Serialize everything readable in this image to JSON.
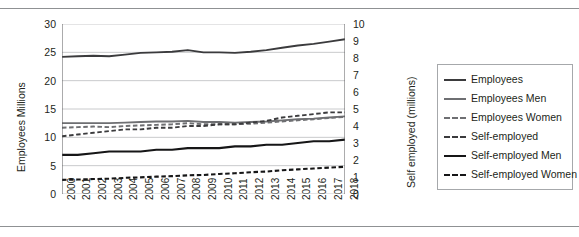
{
  "chart_data": {
    "type": "line",
    "title": "",
    "xlabel": "",
    "ylabel": "Employees Millions",
    "y2label": "Self employed (millions)",
    "grid": true,
    "legend_position": "right",
    "x": [
      2000,
      2001,
      2002,
      2003,
      2004,
      2005,
      2006,
      2007,
      2008,
      2009,
      2010,
      2011,
      2012,
      2013,
      2014,
      2015,
      2016,
      2017,
      2018
    ],
    "categories": [
      "2000",
      "2001",
      "2002",
      "2003",
      "2004",
      "2005",
      "2006",
      "2007",
      "2008",
      "2009",
      "2010",
      "2011",
      "2012",
      "2013",
      "2014",
      "2015",
      "2016",
      "2017",
      "2018"
    ],
    "ylim": [
      0,
      30
    ],
    "yticks": [
      0,
      5,
      10,
      15,
      20,
      25,
      30
    ],
    "y2lim": [
      0,
      10
    ],
    "y2ticks": [
      0,
      1,
      2,
      3,
      4,
      5,
      6,
      7,
      8,
      9,
      10
    ],
    "series": [
      {
        "name": "Employees",
        "axis": "left",
        "style": "solid",
        "color": "#3b3b3d",
        "values": [
          24.2,
          24.3,
          24.4,
          24.3,
          24.6,
          24.9,
          25.0,
          25.1,
          25.4,
          25.0,
          25.0,
          24.9,
          25.1,
          25.4,
          25.8,
          26.2,
          26.5,
          26.9,
          27.3
        ]
      },
      {
        "name": "Employees Men",
        "axis": "left",
        "style": "solid",
        "color": "#6e6f72",
        "values": [
          12.5,
          12.5,
          12.5,
          12.5,
          12.6,
          12.7,
          12.8,
          12.8,
          12.9,
          12.7,
          12.7,
          12.6,
          12.7,
          12.8,
          13.0,
          13.2,
          13.3,
          13.5,
          13.7
        ]
      },
      {
        "name": "Employees Women",
        "axis": "left",
        "style": "dashed",
        "color": "#6e6f72",
        "values": [
          11.7,
          11.8,
          11.9,
          11.8,
          12.0,
          12.1,
          12.2,
          12.3,
          12.5,
          12.3,
          12.3,
          12.3,
          12.4,
          12.6,
          12.8,
          13.0,
          13.2,
          13.4,
          13.6
        ]
      },
      {
        "name": "Self-employed",
        "axis": "right",
        "style": "dashed",
        "color": "#3b3b3d",
        "values": [
          3.4,
          3.5,
          3.6,
          3.7,
          3.8,
          3.8,
          3.9,
          3.9,
          4.0,
          4.0,
          4.1,
          4.1,
          4.2,
          4.3,
          4.5,
          4.6,
          4.7,
          4.8,
          4.8
        ]
      },
      {
        "name": "Self-employed Men",
        "axis": "right",
        "style": "solid",
        "color": "#161617",
        "values": [
          2.3,
          2.3,
          2.4,
          2.5,
          2.5,
          2.5,
          2.6,
          2.6,
          2.7,
          2.7,
          2.7,
          2.8,
          2.8,
          2.9,
          2.9,
          3.0,
          3.1,
          3.1,
          3.2
        ]
      },
      {
        "name": "Self-employed Women",
        "axis": "right",
        "style": "dashed",
        "color": "#161617",
        "values": [
          0.83,
          0.85,
          0.88,
          0.9,
          0.95,
          0.98,
          1.02,
          1.05,
          1.1,
          1.12,
          1.18,
          1.22,
          1.28,
          1.32,
          1.4,
          1.45,
          1.5,
          1.55,
          1.6
        ]
      }
    ]
  },
  "axes": {
    "left": {
      "title": "Employees Millions",
      "ticks": [
        "30",
        "25",
        "20",
        "15",
        "10",
        "5",
        "0"
      ]
    },
    "right": {
      "title": "Self employed (millions)",
      "ticks": [
        "10",
        "9",
        "8",
        "7",
        "6",
        "5",
        "4",
        "3",
        "2",
        "1",
        "0"
      ]
    },
    "x": {
      "ticks": [
        "2000",
        "2001",
        "2002",
        "2003",
        "2004",
        "2005",
        "2006",
        "2007",
        "2008",
        "2009",
        "2010",
        "2011",
        "2012",
        "2013",
        "2014",
        "2015",
        "2016",
        "2017",
        "2018"
      ]
    }
  },
  "legend": {
    "items": [
      {
        "label": "Employees",
        "swatch": "sw-solid-thick"
      },
      {
        "label": "Employees Men",
        "swatch": "sw-solid-med"
      },
      {
        "label": "Employees Women",
        "swatch": "sw-dash-med"
      },
      {
        "label": "Self-employed",
        "swatch": "sw-dash-dark"
      },
      {
        "label": "Self-employed Men",
        "swatch": "sw-solid-black"
      },
      {
        "label": "Self-employed Women",
        "swatch": "sw-dash-black"
      }
    ]
  },
  "colors": {
    "grid": "#c9cacc",
    "axis": "#58595b",
    "rule": "#8f9193",
    "text": "#231f20"
  }
}
